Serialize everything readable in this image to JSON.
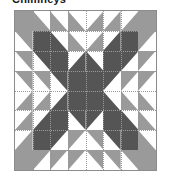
{
  "page": {
    "title": "Chimneys",
    "background": "#ffffff"
  },
  "palette": {
    "white": "#ffffff",
    "medium_gray": "#9a9a9a",
    "dark_gray": "#555555",
    "outline": "#8c8c8c",
    "grid_line": "#9a9a9a",
    "title_color": "#1a1a1a"
  },
  "block": {
    "name": "quilt-block",
    "grid_columns": 8,
    "grid_rows": 8,
    "x": 14,
    "y": 10,
    "width": 143,
    "height": 161,
    "border_color": "#8c8c8c",
    "grid_style": "dotted",
    "legend": {
      "W": "white",
      "M": "medium_gray",
      "D": "dark_gray"
    },
    "shape_codes": {
      "S": "solid square",
      "TL": "triangle filling top-left half",
      "TR": "triangle filling top-right half",
      "BL": "triangle filling bottom-left half",
      "BR": "triangle filling bottom-right half"
    },
    "cells": [
      [
        {
          "shape": "S",
          "fill": "M"
        },
        {
          "shape": "BL",
          "fill": "M"
        },
        {
          "shape": "BL",
          "fill": "M"
        },
        {
          "shape": "BL",
          "fill": "M"
        },
        {
          "shape": "BR",
          "fill": "M"
        },
        {
          "shape": "BR",
          "fill": "M"
        },
        {
          "shape": "BR",
          "fill": "M"
        },
        {
          "shape": "S",
          "fill": "M"
        }
      ],
      [
        {
          "shape": "TR",
          "fill": "M"
        },
        {
          "shape": "S",
          "fill": "D"
        },
        {
          "shape": "BL",
          "fill": "D"
        },
        {
          "shape": "BL",
          "fill": "M"
        },
        {
          "shape": "BR",
          "fill": "M"
        },
        {
          "shape": "BR",
          "fill": "D"
        },
        {
          "shape": "S",
          "fill": "D"
        },
        {
          "shape": "TL",
          "fill": "M"
        }
      ],
      [
        {
          "shape": "TR",
          "fill": "M"
        },
        {
          "shape": "TR",
          "fill": "D"
        },
        {
          "shape": "S",
          "fill": "D"
        },
        {
          "shape": "BR",
          "fill": "D"
        },
        {
          "shape": "BL",
          "fill": "D"
        },
        {
          "shape": "S",
          "fill": "D"
        },
        {
          "shape": "TL",
          "fill": "D"
        },
        {
          "shape": "TL",
          "fill": "M"
        }
      ],
      [
        {
          "shape": "TR",
          "fill": "M"
        },
        {
          "shape": "TR",
          "fill": "M"
        },
        {
          "shape": "TR",
          "fill": "D"
        },
        {
          "shape": "S",
          "fill": "D"
        },
        {
          "shape": "S",
          "fill": "D"
        },
        {
          "shape": "TL",
          "fill": "D"
        },
        {
          "shape": "TL",
          "fill": "M"
        },
        {
          "shape": "TL",
          "fill": "M"
        }
      ],
      [
        {
          "shape": "BR",
          "fill": "M"
        },
        {
          "shape": "BR",
          "fill": "M"
        },
        {
          "shape": "BR",
          "fill": "D"
        },
        {
          "shape": "S",
          "fill": "D"
        },
        {
          "shape": "S",
          "fill": "D"
        },
        {
          "shape": "BL",
          "fill": "D"
        },
        {
          "shape": "BL",
          "fill": "M"
        },
        {
          "shape": "BL",
          "fill": "M"
        }
      ],
      [
        {
          "shape": "BR",
          "fill": "M"
        },
        {
          "shape": "BR",
          "fill": "D"
        },
        {
          "shape": "S",
          "fill": "D"
        },
        {
          "shape": "TR",
          "fill": "D"
        },
        {
          "shape": "TL",
          "fill": "D"
        },
        {
          "shape": "S",
          "fill": "D"
        },
        {
          "shape": "BL",
          "fill": "D"
        },
        {
          "shape": "BL",
          "fill": "M"
        }
      ],
      [
        {
          "shape": "BR",
          "fill": "M"
        },
        {
          "shape": "S",
          "fill": "D"
        },
        {
          "shape": "TL",
          "fill": "D"
        },
        {
          "shape": "TL",
          "fill": "M"
        },
        {
          "shape": "TR",
          "fill": "M"
        },
        {
          "shape": "TR",
          "fill": "D"
        },
        {
          "shape": "S",
          "fill": "D"
        },
        {
          "shape": "BL",
          "fill": "M"
        }
      ],
      [
        {
          "shape": "S",
          "fill": "M"
        },
        {
          "shape": "TL",
          "fill": "M"
        },
        {
          "shape": "TL",
          "fill": "M"
        },
        {
          "shape": "TL",
          "fill": "M"
        },
        {
          "shape": "TR",
          "fill": "M"
        },
        {
          "shape": "TR",
          "fill": "M"
        },
        {
          "shape": "TR",
          "fill": "M"
        },
        {
          "shape": "S",
          "fill": "M"
        }
      ]
    ]
  }
}
